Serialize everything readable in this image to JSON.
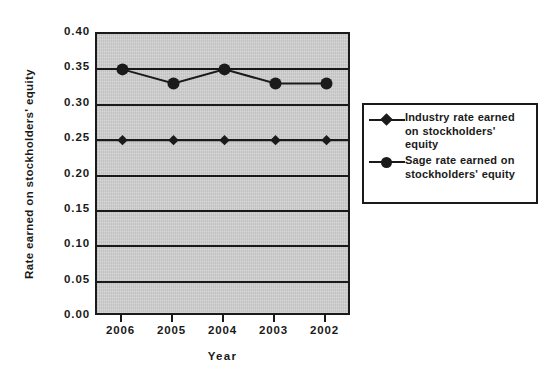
{
  "chart_data": {
    "type": "line",
    "title": "",
    "xlabel": "Year",
    "ylabel": "Rate earned on stockholders' equity",
    "categories": [
      "2006",
      "2005",
      "2004",
      "2003",
      "2002"
    ],
    "series": [
      {
        "name": "Industry rate earned on stockholders' equity",
        "marker": "diamond",
        "color": "#1a1a1a",
        "values": [
          0.25,
          0.25,
          0.25,
          0.25,
          0.25
        ]
      },
      {
        "name": "Sage rate earned on stockholders' equity",
        "marker": "circle",
        "color": "#1a1a1a",
        "values": [
          0.35,
          0.33,
          0.35,
          0.33,
          0.33
        ]
      }
    ],
    "ylim": [
      0.0,
      0.4
    ],
    "ytick_labels": [
      "0.40",
      "0.35",
      "0.30",
      "0.25",
      "0.20",
      "0.15",
      "0.10",
      "0.05",
      "0.00"
    ],
    "ytick_values": [
      0.4,
      0.35,
      0.3,
      0.25,
      0.2,
      0.15,
      0.1,
      0.05,
      0.0
    ],
    "grid": true,
    "grid_orientation": "horizontal",
    "legend_position": "right",
    "plot_background": "#c9c9c9",
    "figure_background": "#ffffff",
    "axis_color": "#1a1a1a"
  },
  "legend": {
    "entries": [
      {
        "label": "Industry rate earned on stockholders' equity",
        "marker": "diamond"
      },
      {
        "label": "Sage rate earned on stockholders' equity",
        "marker": "circle"
      }
    ]
  }
}
